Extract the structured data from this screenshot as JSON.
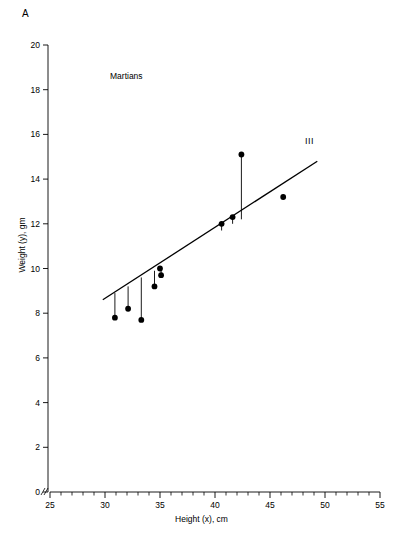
{
  "figure": {
    "panel_letter": "A",
    "annotation": "Martians",
    "series_label": "III"
  },
  "chart_data": {
    "type": "scatter",
    "title": "",
    "subtitle": "",
    "annotation": "Martians",
    "xlabel": "Height (x), cm",
    "ylabel": "Weight (y), gm",
    "xlim": [
      25,
      55
    ],
    "ylim": [
      0,
      20
    ],
    "x_major_ticks": [
      25,
      30,
      35,
      40,
      45,
      50,
      55
    ],
    "x_tick_labels": [
      "25",
      "30",
      "35",
      "40",
      "45",
      "50",
      "55"
    ],
    "x_minor_interval": 1,
    "y_major_ticks": [
      0,
      2,
      4,
      6,
      8,
      10,
      12,
      14,
      16,
      18,
      20
    ],
    "y_tick_labels": [
      "0",
      "2",
      "4",
      "6",
      "8",
      "10",
      "12",
      "14",
      "16",
      "18",
      "20"
    ],
    "grid": false,
    "legend": "none",
    "axis_break_x": true,
    "marker": "filled-circle",
    "marker_color": "#000000",
    "line_color": "#000000",
    "points": [
      {
        "x": 30.9,
        "y": 7.8
      },
      {
        "x": 32.1,
        "y": 8.2
      },
      {
        "x": 33.3,
        "y": 7.7
      },
      {
        "x": 34.5,
        "y": 9.2
      },
      {
        "x": 35.0,
        "y": 10.0
      },
      {
        "x": 35.1,
        "y": 9.7
      },
      {
        "x": 40.6,
        "y": 12.0
      },
      {
        "x": 41.6,
        "y": 12.3
      },
      {
        "x": 42.4,
        "y": 15.1
      },
      {
        "x": 46.2,
        "y": 13.2
      }
    ],
    "residual_lines": [
      {
        "x": 30.9,
        "y_point": 7.8,
        "y_fit": 8.9
      },
      {
        "x": 32.1,
        "y_point": 8.2,
        "y_fit": 9.2
      },
      {
        "x": 33.3,
        "y_point": 7.7,
        "y_fit": 9.6
      },
      {
        "x": 34.5,
        "y_point": 9.2,
        "y_fit": 9.9
      },
      {
        "x": 35.0,
        "y_point": 10.0,
        "y_fit": 10.1
      },
      {
        "x": 35.1,
        "y_point": 9.7,
        "y_fit": 10.1
      },
      {
        "x": 40.6,
        "y_point": 12.0,
        "y_fit": 11.7
      },
      {
        "x": 41.6,
        "y_point": 12.3,
        "y_fit": 12.0
      },
      {
        "x": 42.4,
        "y_point": 15.1,
        "y_fit": 12.2
      },
      {
        "x": 46.2,
        "y_point": 13.2,
        "y_fit": 13.3
      }
    ],
    "fit_line": {
      "name": "III",
      "x_start": 29.8,
      "y_start": 8.6,
      "x_end": 49.3,
      "y_end": 14.8
    },
    "series": [
      {
        "name": "Martians",
        "x": [
          30.9,
          32.1,
          33.3,
          34.5,
          35.0,
          35.1,
          40.6,
          41.6,
          42.4,
          46.2
        ],
        "values": [
          7.8,
          8.2,
          7.7,
          9.2,
          10.0,
          9.7,
          12.0,
          12.3,
          15.1,
          13.2
        ]
      }
    ]
  }
}
